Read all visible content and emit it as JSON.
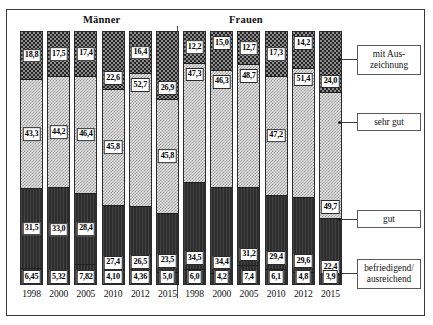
{
  "figure": {
    "groups": [
      {
        "id": "maenner",
        "label": "Männer"
      },
      {
        "id": "frauen",
        "label": "Frauen"
      }
    ]
  },
  "legend": {
    "items": [
      {
        "key": "mit_auszeichnung",
        "label": "mit Aus-\nzeichnung",
        "line1": "mit Aus-",
        "line2": "zeichnung"
      },
      {
        "key": "sehr_gut",
        "label": "sehr gut",
        "line1": "sehr gut",
        "line2": ""
      },
      {
        "key": "gut",
        "label": "gut",
        "line1": "gut",
        "line2": ""
      },
      {
        "key": "befriedigend",
        "label": "befriedigend/\nausreichend",
        "line1": "befriedigend/",
        "line2": "ausreichend"
      }
    ]
  },
  "chart_data": {
    "type": "bar",
    "subtype": "stacked-100-percent",
    "title": "",
    "xlabel": "",
    "ylabel": "",
    "ylim": [
      0,
      100
    ],
    "grid": false,
    "legend_position": "right",
    "group_labels": [
      "Männer",
      "Frauen"
    ],
    "categories": [
      "1998",
      "2000",
      "2005",
      "2010",
      "2012",
      "2015",
      "1998",
      "2000",
      "2005",
      "2010",
      "2012",
      "2015"
    ],
    "series": [
      {
        "name": "mit Auszeichnung",
        "values": [
          18.8,
          17.5,
          17.4,
          22.6,
          16.4,
          26.9,
          12.2,
          15.0,
          12.7,
          17.3,
          14.2,
          24.0
        ],
        "labels": [
          "18,8",
          "17,5",
          "17,4",
          "22,6",
          "16,4",
          "26,9",
          "12,2",
          "15,0",
          "12,7",
          "17,3",
          "14,2",
          "24,0"
        ]
      },
      {
        "name": "sehr gut",
        "values": [
          43.3,
          44.2,
          46.4,
          45.8,
          52.7,
          45.8,
          47.3,
          46.3,
          48.7,
          47.2,
          51.4,
          49.7
        ],
        "labels": [
          "43,3",
          "44,2",
          "46,4",
          "45,8",
          "52,7",
          "45,8",
          "47,3",
          "46,3",
          "48,7",
          "47,2",
          "51,4",
          "49,7"
        ]
      },
      {
        "name": "gut",
        "values": [
          31.5,
          33.0,
          28.4,
          27.4,
          26.5,
          23.5,
          34.5,
          34.4,
          31.2,
          29.4,
          29.6,
          22.4
        ],
        "labels": [
          "31,5",
          "33,0",
          "28,4",
          "27,4",
          "26,5",
          "23,5",
          "34,5",
          "34,4",
          "31,2",
          "29,4",
          "29,6",
          "22,4"
        ]
      },
      {
        "name": "befriedigend/ausreichend",
        "values": [
          6.45,
          5.32,
          7.82,
          4.1,
          4.36,
          5.0,
          6.0,
          4.2,
          7.4,
          6.1,
          4.8,
          3.9
        ],
        "labels": [
          "6,45",
          "5,32",
          "7,82",
          "4,10",
          "4,36",
          "5,0",
          "6,0",
          "4,2",
          "7,4",
          "6,1",
          "4,8",
          "3,9"
        ]
      }
    ],
    "bars": [
      {
        "group": "Männer",
        "year": "1998",
        "mit_auszeichnung": "18,8",
        "sehr_gut": "43,3",
        "gut": "31,5",
        "befriedigend": "6,45",
        "v": [
          18.8,
          43.3,
          31.5,
          6.45
        ],
        "label_pos": [
          "mid",
          "mid",
          "mid",
          "bottom"
        ]
      },
      {
        "group": "Männer",
        "year": "2000",
        "mit_auszeichnung": "17,5",
        "sehr_gut": "44,2",
        "gut": "33,0",
        "befriedigend": "5,32",
        "v": [
          17.5,
          44.2,
          33.0,
          5.32
        ],
        "label_pos": [
          "mid",
          "mid",
          "mid",
          "bottom"
        ]
      },
      {
        "group": "Männer",
        "year": "2005",
        "mit_auszeichnung": "17,4",
        "sehr_gut": "46,4",
        "gut": "28,4",
        "befriedigend": "7,82",
        "v": [
          17.4,
          46.4,
          28.4,
          7.82
        ],
        "label_pos": [
          "mid",
          "mid",
          "mid",
          "bottom"
        ]
      },
      {
        "group": "Männer",
        "year": "2010",
        "mit_auszeichnung": "22,6",
        "sehr_gut": "45,8",
        "gut": "27,4",
        "befriedigend": "4,10",
        "v": [
          22.6,
          45.8,
          27.4,
          4.1
        ],
        "label_pos": [
          "low",
          "mid",
          "low",
          "bottom"
        ]
      },
      {
        "group": "Männer",
        "year": "2012",
        "mit_auszeichnung": "16,4",
        "sehr_gut": "52,7",
        "gut": "26,5",
        "befriedigend": "4,36",
        "v": [
          16.4,
          52.7,
          26.5,
          4.36
        ],
        "label_pos": [
          "mid",
          "high",
          "low",
          "bottom"
        ]
      },
      {
        "group": "Männer",
        "year": "2015",
        "mit_auszeichnung": "26,9",
        "sehr_gut": "45,8",
        "gut": "23,5",
        "befriedigend": "5,0",
        "v": [
          26.9,
          45.8,
          23.5,
          5.0
        ],
        "label_pos": [
          "low",
          "mid",
          "low",
          "bottom"
        ]
      },
      {
        "group": "Frauen",
        "year": "1998",
        "mit_auszeichnung": "12,2",
        "sehr_gut": "47,3",
        "gut": "34,5",
        "befriedigend": "6,0",
        "v": [
          12.2,
          47.3,
          34.5,
          6.0
        ],
        "label_pos": [
          "mid",
          "high",
          "low",
          "bottom"
        ]
      },
      {
        "group": "Frauen",
        "year": "2000",
        "mit_auszeichnung": "15,0",
        "sehr_gut": "46,3",
        "gut": "34,4",
        "befriedigend": "4,2",
        "v": [
          15.0,
          46.3,
          34.4,
          4.2
        ],
        "label_pos": [
          "high",
          "high",
          "low",
          "bottom"
        ]
      },
      {
        "group": "Frauen",
        "year": "2005",
        "mit_auszeichnung": "12,7",
        "sehr_gut": "48,7",
        "gut": "31,2",
        "befriedigend": "7,4",
        "v": [
          12.7,
          48.7,
          31.2,
          7.4
        ],
        "label_pos": [
          "mid",
          "high",
          "low",
          "bottom"
        ]
      },
      {
        "group": "Frauen",
        "year": "2010",
        "mit_auszeichnung": "17,3",
        "sehr_gut": "47,2",
        "gut": "29,4",
        "befriedigend": "6,1",
        "v": [
          17.3,
          47.2,
          29.4,
          6.1
        ],
        "label_pos": [
          "mid",
          "mid",
          "low",
          "bottom"
        ]
      },
      {
        "group": "Frauen",
        "year": "2012",
        "mit_auszeichnung": "14,2",
        "sehr_gut": "51,4",
        "gut": "29,6",
        "befriedigend": "4,8",
        "v": [
          14.2,
          51.4,
          29.6,
          4.8
        ],
        "label_pos": [
          "high",
          "high",
          "low",
          "bottom"
        ]
      },
      {
        "group": "Frauen",
        "year": "2015",
        "mit_auszeichnung": "24,0",
        "sehr_gut": "49,7",
        "gut": "22,4",
        "befriedigend": "3,9",
        "v": [
          24.0,
          49.7,
          22.4,
          3.9
        ],
        "label_pos": [
          "low",
          "low",
          "bottom",
          "bottom"
        ]
      }
    ]
  },
  "colors": {
    "mit_auszeichnung": "#3d3d3d",
    "sehr_gut": "#d9d9d9",
    "gut": "#2d2d2d",
    "befriedigend": "#2d2d2d",
    "frame": "#3a3a3a",
    "text": "#111111"
  }
}
